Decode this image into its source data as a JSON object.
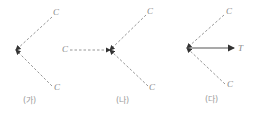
{
  "diagram": {
    "panels": [
      {
        "caption": "(가)",
        "point": [
          16,
          50
        ],
        "forces": [
          {
            "label": "C",
            "style": "dashed",
            "from": [
              52,
              17
            ],
            "label_pos": [
              53,
              8
            ]
          },
          {
            "label": "C",
            "style": "dashed",
            "from": [
              52,
              86
            ],
            "label_pos": [
              54,
              83
            ]
          }
        ]
      },
      {
        "caption": "(나)",
        "point": [
          110,
          50
        ],
        "forces": [
          {
            "label": "C",
            "style": "dashed",
            "from": [
              70,
              50
            ],
            "label_pos": [
              62,
              45
            ]
          },
          {
            "label": "C",
            "style": "dashed",
            "from": [
              146,
              15
            ],
            "label_pos": [
              147,
              7
            ]
          },
          {
            "label": "C",
            "style": "dashed",
            "from": [
              148,
              86
            ],
            "label_pos": [
              149,
              83
            ]
          }
        ]
      },
      {
        "caption": "(다)",
        "point": [
          187,
          48
        ],
        "forces": [
          {
            "label": "C",
            "style": "dashed",
            "from": [
              224,
              15
            ],
            "label_pos": [
              226,
              7
            ]
          },
          {
            "label": "C",
            "style": "dashed",
            "from": [
              225,
              84
            ],
            "label_pos": [
              227,
              80
            ]
          },
          {
            "label": "T",
            "style": "solid",
            "to": [
              234,
              48
            ],
            "label_pos": [
              238,
              44
            ]
          }
        ]
      }
    ]
  },
  "colors": {
    "dashed": "#8a8a8a",
    "solid": "#555555",
    "label": "#888888"
  }
}
